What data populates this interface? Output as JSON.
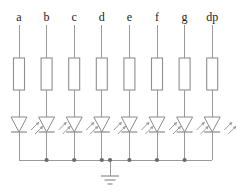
{
  "diagram": {
    "type": "circuit-schematic",
    "width": 237,
    "height": 194,
    "background_color": "#ffffff",
    "wire_color": "#9a9a9a",
    "component_color": "#8a8a8a",
    "junction_color": "#6a6a6a",
    "label_color": "#1c1c1c"
  },
  "branches": [
    {
      "id": "branch-a",
      "label": "a",
      "x": 19,
      "label_x": 19,
      "resistor_name": "resistor-a",
      "led_name": "led-a",
      "has_junction_dot": false
    },
    {
      "id": "branch-b",
      "label": "b",
      "x": 46.6,
      "label_x": 46.6,
      "resistor_name": "resistor-b",
      "led_name": "led-b",
      "has_junction_dot": true
    },
    {
      "id": "branch-c",
      "label": "c",
      "x": 74.2,
      "label_x": 74.2,
      "resistor_name": "resistor-c",
      "led_name": "led-c",
      "has_junction_dot": true
    },
    {
      "id": "branch-d",
      "label": "d",
      "x": 101.8,
      "label_x": 101.8,
      "resistor_name": "resistor-d",
      "led_name": "led-d",
      "has_junction_dot": true
    },
    {
      "id": "branch-e",
      "label": "e",
      "x": 129.4,
      "label_x": 129.4,
      "resistor_name": "resistor-e",
      "led_name": "led-e",
      "has_junction_dot": true
    },
    {
      "id": "branch-f",
      "label": "f",
      "x": 157,
      "label_x": 157,
      "resistor_name": "resistor-f",
      "led_name": "led-f",
      "has_junction_dot": true
    },
    {
      "id": "branch-g",
      "label": "g",
      "x": 184.6,
      "label_x": 184.6,
      "resistor_name": "resistor-g",
      "led_name": "led-g",
      "has_junction_dot": true
    },
    {
      "id": "branch-dp",
      "label": "dp",
      "x": 212.2,
      "label_x": 212.2,
      "resistor_name": "resistor-dp",
      "led_name": "led-dp",
      "has_junction_dot": false
    }
  ],
  "geometry": {
    "wire_top_y": 25,
    "resistor_top_y": 58,
    "resistor_bottom_y": 90,
    "resistor_width": 11,
    "led_top_y": 117,
    "led_bottom_y": 132,
    "led_half_width": 8,
    "bus_y": 160,
    "bus_left_x": 19,
    "bus_right_x": 212.2,
    "label_y": 10
  },
  "ground": {
    "name": "ground-symbol",
    "tap_x": 110,
    "stub_top_y": 160,
    "stub_bottom_y": 176,
    "bar_widths": [
      18,
      11,
      5
    ],
    "bar_spacing": 4,
    "has_junction_dot": true
  }
}
